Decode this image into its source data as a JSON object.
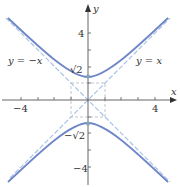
{
  "figure": {
    "type": "hyperbola-graph",
    "equation_curve": "y^2 - x^2 = 2",
    "axes": {
      "x_label": "x",
      "y_label": "y",
      "x_ticks": [
        -4,
        -3,
        -2,
        -1,
        1,
        2,
        3,
        4
      ],
      "y_ticks": [
        -4,
        -3,
        -2,
        -1,
        1,
        2,
        3,
        4
      ],
      "x_tick_labels": [
        {
          "value": -4,
          "text": "−4"
        },
        {
          "value": 4,
          "text": "4"
        }
      ],
      "y_tick_labels": [
        {
          "value": 4,
          "text": "4"
        },
        {
          "value": 1.414,
          "text": "√2"
        },
        {
          "value": -1.414,
          "text": "−√2"
        },
        {
          "value": -4,
          "text": "−4"
        }
      ]
    },
    "asymptotes": [
      {
        "label": "y = −x",
        "equation": "y = -x"
      },
      {
        "label": "y = x",
        "equation": "y = x"
      }
    ],
    "vertices": [
      {
        "x": 0,
        "y": 1.414
      },
      {
        "x": 0,
        "y": -1.414
      }
    ],
    "colors": {
      "curve": "#6f86c8",
      "asymptote": "#a9c2e6",
      "axis": "#555555",
      "vertex_dot": "#7fa3b8"
    }
  },
  "labels": {
    "x_axis": "x",
    "y_axis": "y",
    "x_tick_neg4": "−4",
    "x_tick_4": "4",
    "y_tick_4": "4",
    "y_tick_sqrt2": "√2",
    "y_tick_negsqrt2": "−√2",
    "y_tick_neg4": "−4",
    "asymptote_left": "y = −x",
    "asymptote_right": "y = x"
  }
}
